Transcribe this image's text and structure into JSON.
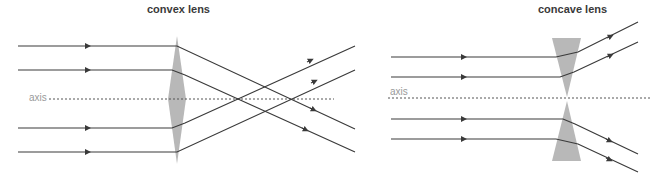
{
  "diagrams": [
    {
      "id": "convex",
      "title": "convex lens",
      "axis_label": "axis"
    },
    {
      "id": "concave",
      "title": "concave lens",
      "axis_label": "axis"
    }
  ],
  "colors": {
    "ray": "#3a3a3a",
    "lens": "#b8b8b8",
    "axis": "#555555",
    "axis_label": "#9a9a9a",
    "title": "#3a3a3a"
  }
}
